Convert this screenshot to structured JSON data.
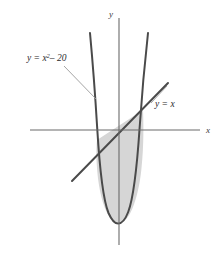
{
  "figure": {
    "background_color": "#ffffff"
  },
  "axes": {
    "x_label": "x",
    "y_label": "y",
    "axis_color": "#6b6b6b",
    "x_axis": {
      "x1": 30,
      "y1": 130,
      "x2": 200,
      "y2": 130
    },
    "y_axis": {
      "x1": 119,
      "y1": 18,
      "x2": 119,
      "y2": 245
    }
  },
  "curves": [
    {
      "name": "parabola",
      "label": "y = x",
      "label_exponent": "2",
      "label_operator": "–",
      "label_constant": "20",
      "color": "#4a4a4a",
      "stroke_width": 2.0
    },
    {
      "name": "line",
      "label": "y = x",
      "color": "#4a4a4a",
      "stroke_width": 2.0
    }
  ],
  "labels": {
    "parabola_label_prefix": "y = x",
    "parabola_label_exponent": "2",
    "parabola_label_suffix": "– 20",
    "line_label": "y = x"
  },
  "region": {
    "name": "shaded-region",
    "fill_color": "#d6d6d6",
    "stroke_color": "#5a5a5a"
  },
  "geometry": {
    "origin": {
      "x": 119,
      "y": 130
    },
    "vertex": {
      "x": 118,
      "y": 222
    },
    "intersection_left": {
      "x": 97,
      "y": 140
    },
    "intersection_right": {
      "x": 143,
      "y": 110
    },
    "line_start": {
      "x": 72,
      "y": 181
    },
    "line_end": {
      "x": 168,
      "y": 83
    },
    "parabola_left_top": {
      "x": 90,
      "y": 33
    },
    "parabola_right_top": {
      "x": 148,
      "y": 33
    },
    "leader_parabola": {
      "x1": 64,
      "y1": 66,
      "x2": 96,
      "y2": 99
    },
    "leader_line": {
      "x1": 151,
      "y1": 103,
      "x2": 167,
      "y2": 88
    }
  }
}
